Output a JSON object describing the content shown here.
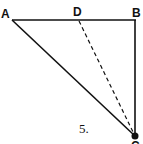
{
  "figure": {
    "caption": "5.",
    "points": {
      "A": {
        "label": "A",
        "x": 10,
        "y": 20
      },
      "D": {
        "label": "D",
        "x": 79,
        "y": 20
      },
      "B": {
        "label": "B",
        "x": 136,
        "y": 20
      },
      "C": {
        "label": "C",
        "x": 135,
        "y": 136
      }
    },
    "segments": [
      {
        "from": "A",
        "to": "B",
        "style": "solid"
      },
      {
        "from": "B",
        "to": "C",
        "style": "solid"
      },
      {
        "from": "A",
        "to": "C",
        "style": "solid"
      },
      {
        "from": "D",
        "to": "C",
        "style": "dashed"
      }
    ],
    "colors": {
      "stroke": "#111111",
      "background": "#ffffff"
    }
  }
}
